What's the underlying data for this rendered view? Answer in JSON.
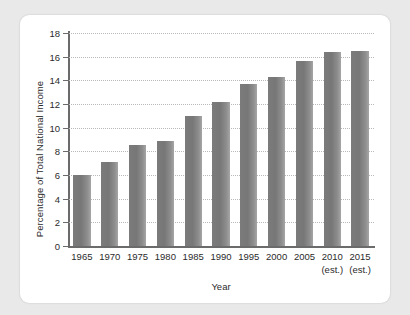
{
  "chart_data": {
    "type": "bar",
    "title": "",
    "xlabel": "Year",
    "ylabel": "Percentage of Total National Income",
    "categories": [
      "1965",
      "1970",
      "1975",
      "1980",
      "1985",
      "1990",
      "1995",
      "2000",
      "2005",
      "2010",
      "2015"
    ],
    "category_notes": [
      "",
      "",
      "",
      "",
      "",
      "",
      "",
      "",
      "",
      "(est.)",
      "(est.)"
    ],
    "values": [
      6.0,
      7.1,
      8.5,
      8.9,
      11.0,
      12.2,
      13.7,
      14.3,
      15.6,
      16.4,
      16.5
    ],
    "ylim": [
      0,
      18
    ],
    "ytick_labels": [
      "0",
      "2",
      "4",
      "6",
      "8",
      "10",
      "12",
      "14",
      "16",
      "18"
    ],
    "ytick_values": [
      0,
      2,
      4,
      6,
      8,
      10,
      12,
      14,
      16,
      18
    ],
    "grid": true,
    "grid_style": "dotted-horizontal",
    "legend": "none",
    "bar_color": "#7f7f7f",
    "axis_color": "#6b6b6b",
    "grid_color": "#b9b9b9",
    "text_color": "#2b2b2b",
    "background": "#ffffff",
    "page_background": "#e9e9e9"
  }
}
